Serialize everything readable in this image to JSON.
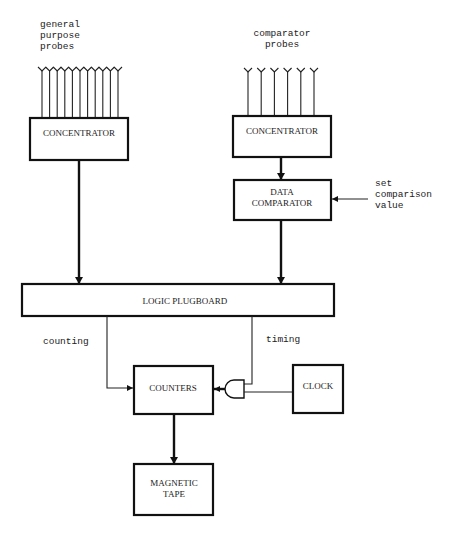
{
  "diagram": {
    "labels": {
      "general_probes": [
        "general",
        "purpose",
        "probes"
      ],
      "comparator_probes": [
        "comparator",
        "probes"
      ],
      "set_value": [
        "set",
        "comparison",
        "value"
      ],
      "counting": "counting",
      "timing": "timing"
    },
    "blocks": {
      "concentrator_left": [
        "CONCENTRATOR"
      ],
      "concentrator_right": [
        "CONCENTRATOR"
      ],
      "data_comparator": [
        "DATA",
        "COMPARATOR"
      ],
      "logic_plugboard": [
        "LOGIC PLUGBOARD"
      ],
      "counters": [
        "COUNTERS"
      ],
      "clock": [
        "CLOCK"
      ],
      "magnetic_tape": [
        "MAGNETIC",
        "TAPE"
      ]
    },
    "probe_counts": {
      "general_purpose": 11,
      "comparator": 6
    },
    "colors": {
      "line": "#111111",
      "background": "#ffffff"
    }
  }
}
